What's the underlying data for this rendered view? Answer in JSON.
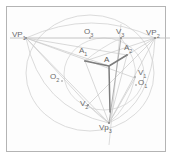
{
  "figure": {
    "type": "geometric-diagram",
    "canvas": {
      "width": 174,
      "height": 160
    },
    "frame": {
      "x": 6,
      "y": 6,
      "width": 160,
      "height": 146,
      "stroke": "#b4b4b4"
    },
    "colors": {
      "frame": "#b4b4b4",
      "construction_line": "#c9c9c9",
      "arc": "#cfcfcf",
      "accent_line": "#9a9a9a",
      "emphasis_line": "#7a7a7a",
      "label_text": "#6b6b6b",
      "background": "#fdfdfd"
    },
    "horizon": {
      "y": 38,
      "x1": 10,
      "x2": 170,
      "label": "horizon-line"
    },
    "points": [
      {
        "id": "VP1",
        "label": "VP",
        "sub": "1",
        "x": 26,
        "y": 38,
        "label_x": 12,
        "label_y": 31
      },
      {
        "id": "O3",
        "label": "O",
        "sub": "3",
        "x": 90,
        "y": 38,
        "label_x": 84,
        "label_y": 28
      },
      {
        "id": "V3",
        "label": "V",
        "sub": "3",
        "x": 121,
        "y": 38,
        "label_x": 116,
        "label_y": 28
      },
      {
        "id": "VP2",
        "label": "VP",
        "sub": "2",
        "x": 155,
        "y": 38,
        "label_x": 146,
        "label_y": 29
      },
      {
        "id": "A1",
        "label": "A",
        "sub": "1",
        "x": 85,
        "y": 61,
        "label_x": 79,
        "label_y": 47
      },
      {
        "id": "A2",
        "label": "A",
        "sub": "2",
        "x": 127,
        "y": 55,
        "label_x": 124,
        "label_y": 44
      },
      {
        "id": "A",
        "label": "A",
        "sub": "",
        "x": 109,
        "y": 66,
        "label_x": 104,
        "label_y": 56
      },
      {
        "id": "O2",
        "label": "O",
        "sub": "2",
        "x": 62,
        "y": 81,
        "label_x": 50,
        "label_y": 73
      },
      {
        "id": "V1",
        "label": "V",
        "sub": "1",
        "x": 135,
        "y": 77,
        "label_x": 138,
        "label_y": 69
      },
      {
        "id": "O1",
        "label": "O",
        "sub": "1",
        "x": 136,
        "y": 85,
        "label_x": 138,
        "label_y": 79
      },
      {
        "id": "V2",
        "label": "V",
        "sub": "2",
        "x": 88,
        "y": 105,
        "label_x": 80,
        "label_y": 100
      },
      {
        "id": "Vp3",
        "label": "Vp",
        "sub": "3",
        "x": 109,
        "y": 123,
        "label_x": 99,
        "label_y": 124
      }
    ],
    "labels": [
      {
        "name": "label-vp1",
        "text": "VP",
        "sub": "1"
      },
      {
        "name": "label-o3",
        "text": "O",
        "sub": "3"
      },
      {
        "name": "label-v3",
        "text": "V",
        "sub": "3"
      },
      {
        "name": "label-vp2",
        "text": "VP",
        "sub": "2"
      },
      {
        "name": "label-a1",
        "text": "A",
        "sub": "1"
      },
      {
        "name": "label-a2",
        "text": "A",
        "sub": "2"
      },
      {
        "name": "label-a",
        "text": "A",
        "sub": ""
      },
      {
        "name": "label-o2",
        "text": "O",
        "sub": "2"
      },
      {
        "name": "label-v1",
        "text": "V",
        "sub": "1"
      },
      {
        "name": "label-o1",
        "text": "O",
        "sub": "1"
      },
      {
        "name": "label-v2",
        "text": "V",
        "sub": "2"
      },
      {
        "name": "label-vp3",
        "text": "Vp",
        "sub": "3"
      }
    ]
  }
}
